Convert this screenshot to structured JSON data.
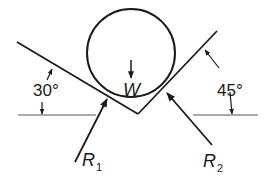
{
  "diagram": {
    "left_plane": {
      "angle_label": "30°",
      "angle_deg": 30
    },
    "right_plane": {
      "angle_label": "45°",
      "angle_deg": 45
    },
    "weight": {
      "label": "W"
    },
    "reactions": [
      {
        "label": "R",
        "subscript": "1"
      },
      {
        "label": "R",
        "subscript": "2"
      }
    ],
    "colors": {
      "stroke": "#1a1a1a",
      "background": "#ffffff"
    }
  }
}
